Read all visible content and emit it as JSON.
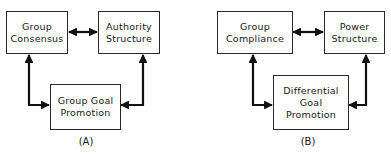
{
  "diagram_a": {
    "caption": "(A)",
    "nodes": {
      "top_left": {
        "line1": "Group",
        "line2": "Consensus"
      },
      "top_right": {
        "line1": "Authority",
        "line2": "Structure"
      },
      "bottom": {
        "line1": "Group Goal",
        "line2": "Promotion"
      }
    },
    "edges": [
      {
        "from": "top_left",
        "to": "top_right",
        "type": "bidirectional"
      },
      {
        "from": "top_left",
        "to": "bottom",
        "type": "bidirectional"
      },
      {
        "from": "top_right",
        "to": "bottom",
        "type": "bidirectional"
      }
    ]
  },
  "diagram_b": {
    "caption": "(B)",
    "nodes": {
      "top_left": {
        "line1": "Group",
        "line2": "Compliance"
      },
      "top_right": {
        "line1": "Power",
        "line2": "Structure"
      },
      "bottom": {
        "line1": "Differential",
        "line2": "Goal",
        "line3": "Promotion"
      }
    },
    "edges": [
      {
        "from": "top_left",
        "to": "top_right",
        "type": "bidirectional"
      },
      {
        "from": "top_left",
        "to": "bottom",
        "type": "bidirectional"
      },
      {
        "from": "top_right",
        "to": "bottom",
        "type": "bidirectional"
      }
    ]
  }
}
